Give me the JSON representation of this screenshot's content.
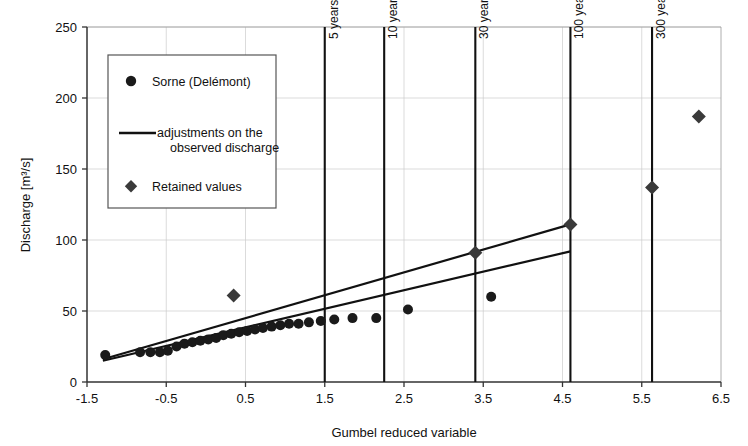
{
  "chart_data": {
    "type": "scatter",
    "title": "",
    "xlabel": "Gumbel reduced variable",
    "ylabel": "Discharge [m3/s]",
    "ylabel_display": "Discharge [m³/s]",
    "xlim": [
      -1.5,
      6.5
    ],
    "ylim": [
      0,
      250
    ],
    "xticks": [
      "-1.5",
      "-0.5",
      "0.5",
      "1.5",
      "2.5",
      "3.5",
      "4.5",
      "5.5",
      "6.5"
    ],
    "xtick_values": [
      -1.5,
      -0.5,
      0.5,
      1.5,
      2.5,
      3.5,
      4.5,
      5.5,
      6.5
    ],
    "yticks": [
      "0",
      "50",
      "100",
      "150",
      "200",
      "250"
    ],
    "ytick_values": [
      0,
      50,
      100,
      150,
      200,
      250
    ],
    "grid": true,
    "grid_color": "#cccccc",
    "legend_position": "upper-left-inside",
    "series": [
      {
        "name": "Sorne (Delémont)",
        "marker": "circle",
        "color": "#1a1a1a",
        "points": [
          {
            "x": -1.27,
            "y": 19
          },
          {
            "x": -0.83,
            "y": 21
          },
          {
            "x": -0.7,
            "y": 21
          },
          {
            "x": -0.58,
            "y": 21
          },
          {
            "x": -0.48,
            "y": 22
          },
          {
            "x": -0.37,
            "y": 25
          },
          {
            "x": -0.27,
            "y": 27
          },
          {
            "x": -0.17,
            "y": 28
          },
          {
            "x": -0.07,
            "y": 29
          },
          {
            "x": 0.03,
            "y": 30
          },
          {
            "x": 0.13,
            "y": 31
          },
          {
            "x": 0.22,
            "y": 33
          },
          {
            "x": 0.32,
            "y": 34
          },
          {
            "x": 0.42,
            "y": 35
          },
          {
            "x": 0.52,
            "y": 36
          },
          {
            "x": 0.62,
            "y": 37
          },
          {
            "x": 0.72,
            "y": 38
          },
          {
            "x": 0.83,
            "y": 39
          },
          {
            "x": 0.94,
            "y": 40
          },
          {
            "x": 1.05,
            "y": 41
          },
          {
            "x": 1.17,
            "y": 41
          },
          {
            "x": 1.3,
            "y": 42
          },
          {
            "x": 1.45,
            "y": 43
          },
          {
            "x": 1.62,
            "y": 44
          },
          {
            "x": 1.85,
            "y": 45
          },
          {
            "x": 2.15,
            "y": 45
          },
          {
            "x": 2.55,
            "y": 51
          },
          {
            "x": 3.6,
            "y": 60
          }
        ]
      },
      {
        "name": "Retained values",
        "marker": "diamond",
        "color": "#3a3a3a",
        "points": [
          {
            "x": 0.35,
            "y": 61
          },
          {
            "x": 3.4,
            "y": 91
          },
          {
            "x": 4.6,
            "y": 111
          },
          {
            "x": 5.63,
            "y": 137
          },
          {
            "x": 6.22,
            "y": 187
          }
        ]
      }
    ],
    "fit_lines": [
      {
        "name": "adjustments on the observed discharge (upper)",
        "x0": -1.3,
        "y0": 16,
        "x1": 4.6,
        "y1": 111,
        "color": "#111111",
        "width": 2.2
      },
      {
        "name": "adjustments on the observed discharge (lower)",
        "x0": -1.3,
        "y0": 15,
        "x1": 4.6,
        "y1": 92,
        "color": "#111111",
        "width": 2.2
      }
    ],
    "return_period_lines": [
      {
        "label": "5 years",
        "x": 1.5
      },
      {
        "label": "10 years",
        "x": 2.25
      },
      {
        "label": "30 years",
        "x": 3.4
      },
      {
        "label": "100 years",
        "x": 4.6
      },
      {
        "label": "300 years",
        "x": 5.63
      }
    ]
  },
  "legend": {
    "items": [
      {
        "label": "Sorne (Delémont)",
        "marker": "circle"
      },
      {
        "label": "adjustments on the",
        "label2": "observed discharge",
        "marker": "line"
      },
      {
        "label": "Retained values",
        "marker": "diamond"
      }
    ]
  }
}
